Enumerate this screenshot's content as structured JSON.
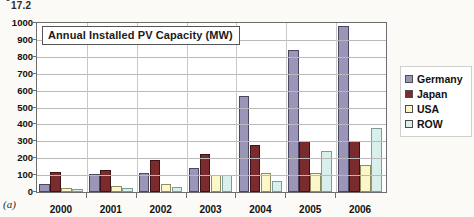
{
  "stray_text": "17.2",
  "figure_label": "(a)",
  "chart_data": {
    "type": "bar",
    "title": "Annual Installed PV Capacity (MW)",
    "xlabel": "",
    "ylabel": "",
    "ylim": [
      0,
      1000
    ],
    "ytick_step": 100,
    "grid": true,
    "legend_position": "right",
    "categories": [
      "2000",
      "2001",
      "2002",
      "2003",
      "2004",
      "2005",
      "2006"
    ],
    "ytick_labels": [
      "1000",
      "900",
      "800",
      "700",
      "600",
      "500",
      "400",
      "300",
      "200",
      "100",
      "0"
    ],
    "series": [
      {
        "name": "Germany",
        "color": "#9b96b8",
        "values": [
          45,
          105,
          110,
          140,
          570,
          840,
          980
        ]
      },
      {
        "name": "Japan",
        "color": "#7a2b2e",
        "values": [
          120,
          130,
          190,
          225,
          280,
          300,
          300
        ]
      },
      {
        "name": "USA",
        "color": "#fbf7c9",
        "values": [
          22,
          35,
          45,
          100,
          110,
          110,
          160
        ]
      },
      {
        "name": "ROW",
        "color": "#d9efeb",
        "values": [
          15,
          25,
          30,
          100,
          65,
          240,
          380
        ]
      }
    ]
  }
}
